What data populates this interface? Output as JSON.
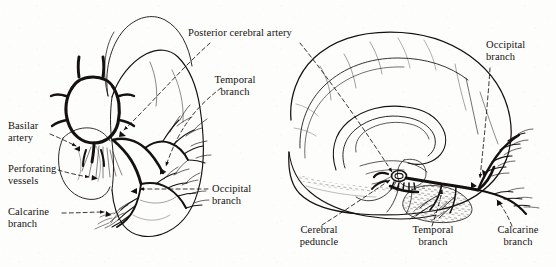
{
  "figure": {
    "background_color": "#fdfdfc",
    "ink_color": "#14110f",
    "style": "line-drawing",
    "panels": [
      {
        "id": "left-panel",
        "name": "basal-view",
        "description": "Inferior (basal) view of occipital and temporal lobes with circle of Willis and posterior cerebral artery branches"
      },
      {
        "id": "right-panel",
        "name": "midsagittal-view",
        "description": "Midsagittal view of cerebral hemisphere showing course of posterior cerebral artery"
      }
    ]
  },
  "labels": {
    "posterior_cerebral_artery": "Posterior cerebral artery",
    "temporal_branch_left": "Temporal\nbranch",
    "basilar_artery": "Basilar\nartery",
    "perforating_vessels": "Perforating\nvessels",
    "calcarine_branch_left": "Calcarine\nbranch",
    "occipital_branch_left": "Occipital\nbranch",
    "occipital_branch_right": "Occipital\nbranch",
    "cerebral_peduncle": "Cerebral\npeduncle",
    "temporal_branch_right": "Temporal\nbranch",
    "calcarine_branch_right": "Calcarine\nbranch"
  },
  "leader_lines": {
    "style": "dashed",
    "arrowheads": true,
    "count": 10
  }
}
